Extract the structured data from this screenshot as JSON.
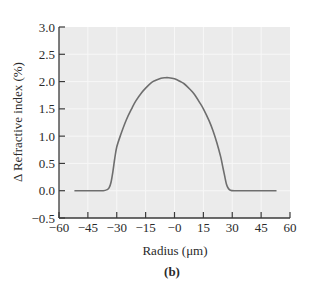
{
  "chart_data": {
    "type": "line",
    "title": "",
    "panel_label": "(b)",
    "xlabel": "Radius (μm)",
    "ylabel": "Δ Refractive index (%)",
    "xlim": [
      -60,
      60
    ],
    "ylim": [
      -0.5,
      3.0
    ],
    "xticks": [
      -60,
      -45,
      -30,
      -15,
      0,
      15,
      30,
      45,
      60
    ],
    "xtick_labels": [
      "−60",
      "−45",
      "−30",
      "−15",
      "−0",
      "15",
      "30",
      "45",
      "60"
    ],
    "yticks": [
      3.0,
      2.5,
      2.0,
      1.5,
      1.0,
      0.5,
      0.0,
      -0.5
    ],
    "ytick_labels": [
      "3.0",
      "2.5",
      "2.0",
      "1.5",
      "1.0",
      "0.5",
      "0.0",
      "−0.5"
    ],
    "grid": true,
    "legend": null,
    "colors": {
      "plot_background": "#ebebeb",
      "grid": "#f7f7f7",
      "line": "#6e6e6e",
      "axis": "#3a3a3a"
    },
    "series": [
      {
        "name": "Refractive index profile",
        "x": [
          -52,
          -40,
          -37,
          -35,
          -34,
          -33,
          -32,
          -31,
          -30,
          -28,
          -25,
          -22,
          -20,
          -17,
          -15,
          -12,
          -10,
          -7,
          -5,
          -3,
          0,
          3,
          5,
          8,
          10,
          13,
          15,
          18,
          20,
          22,
          24,
          25,
          26,
          27,
          28,
          29,
          31,
          35,
          45,
          53
        ],
        "y": [
          0.0,
          0.0,
          0.0,
          0.02,
          0.05,
          0.15,
          0.35,
          0.6,
          0.8,
          1.02,
          1.3,
          1.52,
          1.65,
          1.8,
          1.88,
          1.98,
          2.02,
          2.06,
          2.07,
          2.07,
          2.05,
          2.0,
          1.96,
          1.86,
          1.78,
          1.62,
          1.5,
          1.28,
          1.1,
          0.88,
          0.62,
          0.45,
          0.28,
          0.12,
          0.04,
          0.01,
          0.0,
          0.0,
          0.0,
          0.0
        ]
      }
    ]
  }
}
